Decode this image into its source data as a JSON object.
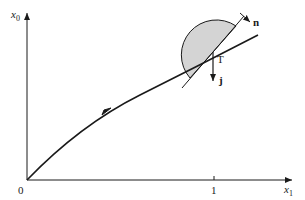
{
  "diagram": {
    "axes": {
      "x_label": "x",
      "x_label_sub": "1",
      "y_label": "x",
      "y_label_sub": "0",
      "origin_label": "0",
      "x_tick_label": "1"
    },
    "point_label": "T",
    "vectors": {
      "normal_label": "n",
      "down_label": "j"
    },
    "colors": {
      "line": "#1a1a1a",
      "shade": "#d4d4d4"
    }
  }
}
